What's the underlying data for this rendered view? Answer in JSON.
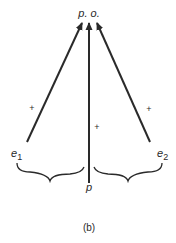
{
  "diagram": {
    "top_node": {
      "label": "p. o."
    },
    "nodes": {
      "e1": {
        "base": "e",
        "sub": "1"
      },
      "p": {
        "label": "p"
      },
      "e2": {
        "base": "e",
        "sub": "2"
      }
    },
    "edges": [
      {
        "from": "e1",
        "to": "p. o.",
        "sign": "+"
      },
      {
        "from": "p",
        "to": "p. o.",
        "sign": "+"
      },
      {
        "from": "e2",
        "to": "p. o.",
        "sign": "+"
      }
    ],
    "caption": "(b)",
    "colors": {
      "stroke": "#2a2a2a",
      "background": "#ffffff"
    }
  }
}
